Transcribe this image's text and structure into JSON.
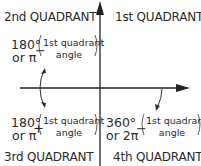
{
  "quadrants": {
    "q1": {
      "label": "1st QUADRANT"
    },
    "q2": {
      "label": "2nd QUADRANT",
      "formula": {
        "line1": "180°",
        "line2": "or π",
        "operator": "−",
        "term_line1": "1st quadrant",
        "term_line2": "angle"
      }
    },
    "q3": {
      "label": "3rd QUADRANT",
      "formula": {
        "line1": "180°",
        "line2": "or π",
        "operator": "+",
        "term_line1": "1st quadrant",
        "term_line2": "angle"
      }
    },
    "q4": {
      "label": "4th QUADRANT",
      "formula": {
        "line1": "360°",
        "line2": "or 2π",
        "operator": "−",
        "term_line1": "1st quadrant",
        "term_line2": "angle"
      }
    }
  },
  "colors": {
    "text": "#2b2b2b",
    "axis": "#222222",
    "background": "#ffffff"
  }
}
